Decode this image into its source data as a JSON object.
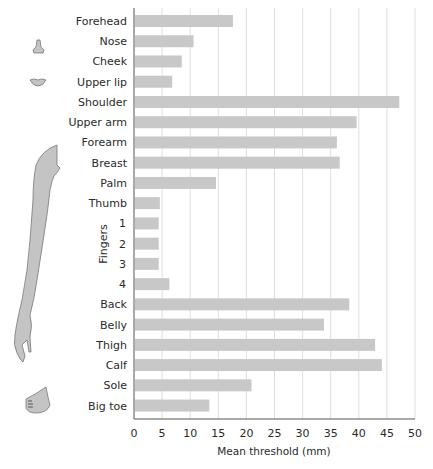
{
  "chart_data": {
    "type": "bar",
    "orientation": "horizontal",
    "title": "",
    "xlabel": "Mean threshold (mm)",
    "ylabel": "",
    "xlim": [
      0,
      50
    ],
    "xticks": [
      0,
      5,
      10,
      15,
      20,
      25,
      30,
      35,
      40,
      45,
      50
    ],
    "grid": true,
    "legend": null,
    "bar_color": "#c8c8c8",
    "group_label": {
      "text": "Fingers",
      "covers": [
        "1",
        "2",
        "3",
        "4"
      ]
    },
    "categories": [
      "Forehead",
      "Nose",
      "Cheek",
      "Upper lip",
      "Shoulder",
      "Upper arm",
      "Forearm",
      "Breast",
      "Palm",
      "Thumb",
      "1",
      "2",
      "3",
      "4",
      "Back",
      "Belly",
      "Thigh",
      "Calf",
      "Sole",
      "Big toe"
    ],
    "values": [
      17.6,
      10.6,
      8.5,
      6.8,
      47.2,
      39.6,
      36.1,
      36.6,
      14.6,
      4.6,
      4.4,
      4.4,
      4.4,
      6.3,
      38.3,
      33.8,
      42.9,
      44.1,
      20.9,
      13.4
    ],
    "illustrations": [
      "nose-icon",
      "lips-icon",
      "arm-icon",
      "foot-icon"
    ]
  }
}
